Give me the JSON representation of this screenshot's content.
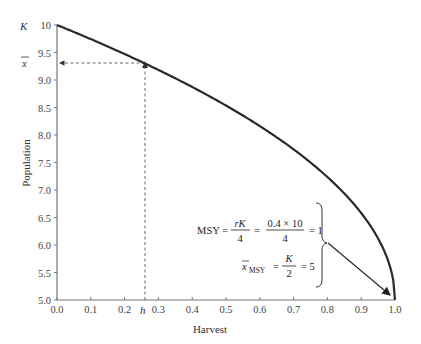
{
  "chart_data": {
    "type": "line",
    "title": "",
    "xlabel": "Harvest",
    "ylabel": "Population",
    "xlim": [
      0.0,
      1.0
    ],
    "ylim": [
      5.0,
      10.0
    ],
    "x_ticks": [
      "0.0",
      "0.1",
      "0.2",
      "0.3",
      "0.4",
      "0.5",
      "0.6",
      "0.7",
      "0.8",
      "0.9",
      "1.0"
    ],
    "y_ticks": [
      "5.0",
      "5.5",
      "6.0",
      "6.5",
      "7.0",
      "7.5",
      "8.0",
      "8.5",
      "9.0",
      "9.5",
      "10"
    ],
    "grid": false,
    "series": [
      {
        "name": "equilibrium population",
        "x": [
          0.0,
          0.1,
          0.2,
          0.26,
          0.3,
          0.4,
          0.5,
          0.6,
          0.7,
          0.8,
          0.9,
          0.95,
          0.99,
          1.0
        ],
        "y": [
          10.0,
          9.74,
          9.47,
          9.3,
          9.18,
          8.87,
          8.54,
          8.16,
          7.74,
          7.24,
          6.58,
          6.12,
          5.5,
          5.0
        ]
      }
    ],
    "annotations": {
      "y_label_K": "K",
      "y_label_xbar": "x̄",
      "x_label_h": "h",
      "h_value": 0.26,
      "xbar_value": 9.3,
      "msy_lhs": "MSY =",
      "msy_frac1_num": "rK",
      "msy_frac1_den": "4",
      "msy_frac2_num": "0.4 × 10",
      "msy_frac2_den": "4",
      "msy_result": "= 1",
      "xmsy_lhs": "x̄",
      "xmsy_sub": "MSY",
      "xmsy_frac_num": "K",
      "xmsy_frac_den": "2",
      "xmsy_result": "= 5",
      "equals": "="
    }
  }
}
